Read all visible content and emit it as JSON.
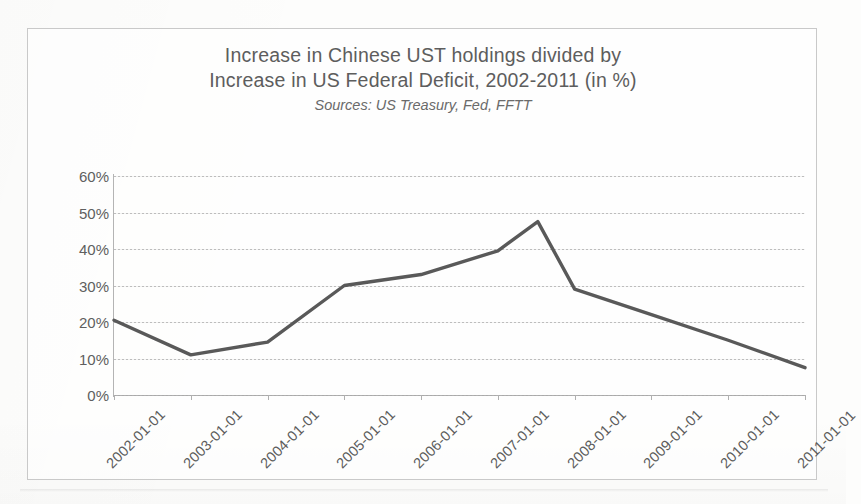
{
  "chart_data": {
    "type": "line",
    "title": "Increase in Chinese UST holdings divided by Increase in US Federal Deficit, 2002-2011 (in %)",
    "title_lines": [
      "Increase in Chinese UST holdings divided by",
      "Increase in US Federal Deficit, 2002-2011 (in %)"
    ],
    "subtitle": "Sources: US Treasury, Fed, FFTT",
    "xlabel": "",
    "ylabel": "",
    "categories": [
      "2002-01-01",
      "2003-01-01",
      "2004-01-01",
      "2005-01-01",
      "2006-01-01",
      "2007-01-01",
      "2008-01-01",
      "2009-01-01",
      "2010-01-01",
      "2011-01-01"
    ],
    "values": [
      20.5,
      11.0,
      14.5,
      30.0,
      33.0,
      39.5,
      29.0,
      22.0,
      15.0,
      7.5
    ],
    "peak": {
      "label": "mid-2007",
      "value": 47.5
    },
    "ylim": [
      0,
      60
    ],
    "ytick_labels": [
      "60%",
      "50%",
      "40%",
      "30%",
      "20%",
      "10%",
      "0%"
    ],
    "ytick_values": [
      60,
      50,
      40,
      30,
      20,
      10,
      0
    ],
    "grid": true,
    "legend": "none",
    "series_color": "#595959",
    "grid_color": "#bdbdbd",
    "text_color": "#5d5d5d",
    "units": "%"
  }
}
